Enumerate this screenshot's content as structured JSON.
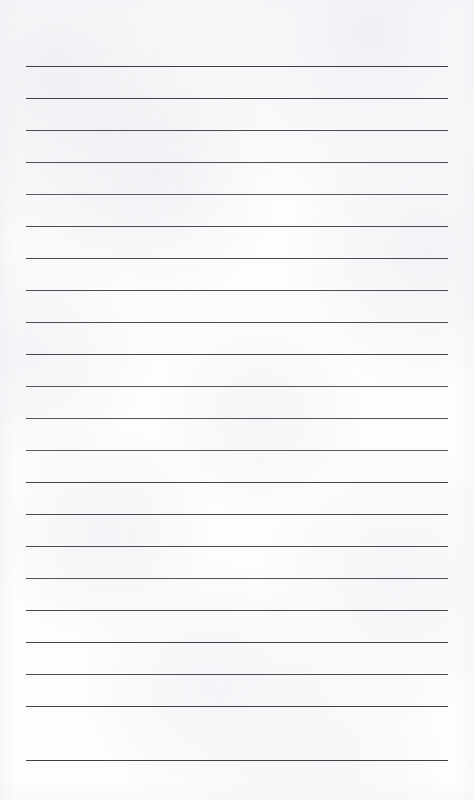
{
  "document": {
    "type": "lined-paper-template",
    "title": "Blank Lined Paper",
    "page_width": 474,
    "page_height": 800,
    "paper_color": "#fdfdfd",
    "line_color": "#4a4a4d",
    "content_text": "",
    "line_count": 22,
    "line_left_x": 26,
    "line_right_x": 448,
    "line_width": 422,
    "first_line_y": 66,
    "line_spacing": 32,
    "line_thickness": 1,
    "lines": [
      {
        "index": 1,
        "y": 66,
        "color": "#3f3f44",
        "thickness": 1,
        "content": ""
      },
      {
        "index": 2,
        "y": 98,
        "color": "#414146",
        "thickness": 1,
        "content": ""
      },
      {
        "index": 3,
        "y": 130,
        "color": "#4b4b50",
        "thickness": 1,
        "content": ""
      },
      {
        "index": 4,
        "y": 162,
        "color": "#4e4e53",
        "thickness": 1,
        "content": ""
      },
      {
        "index": 5,
        "y": 194,
        "color": "#5a5a5f",
        "thickness": 1,
        "content": ""
      },
      {
        "index": 6,
        "y": 226,
        "color": "#4a4a4f",
        "thickness": 1,
        "content": ""
      },
      {
        "index": 7,
        "y": 258,
        "color": "#48484d",
        "thickness": 1,
        "content": ""
      },
      {
        "index": 8,
        "y": 290,
        "color": "#4d4d52",
        "thickness": 1,
        "content": ""
      },
      {
        "index": 9,
        "y": 322,
        "color": "#4c4c51",
        "thickness": 1,
        "content": ""
      },
      {
        "index": 10,
        "y": 354,
        "color": "#45454a",
        "thickness": 1,
        "content": ""
      },
      {
        "index": 11,
        "y": 386,
        "color": "#56565b",
        "thickness": 1,
        "content": ""
      },
      {
        "index": 12,
        "y": 418,
        "color": "#525257",
        "thickness": 1,
        "content": ""
      },
      {
        "index": 13,
        "y": 450,
        "color": "#5b5b60",
        "thickness": 1,
        "content": ""
      },
      {
        "index": 14,
        "y": 482,
        "color": "#45454a",
        "thickness": 1,
        "content": ""
      },
      {
        "index": 15,
        "y": 514,
        "color": "#48484d",
        "thickness": 1,
        "content": ""
      },
      {
        "index": 16,
        "y": 546,
        "color": "#4a4a4f",
        "thickness": 1,
        "content": ""
      },
      {
        "index": 17,
        "y": 578,
        "color": "#515156",
        "thickness": 1,
        "content": ""
      },
      {
        "index": 18,
        "y": 610,
        "color": "#47474c",
        "thickness": 1,
        "content": ""
      },
      {
        "index": 19,
        "y": 642,
        "color": "#434348",
        "thickness": 1,
        "content": ""
      },
      {
        "index": 20,
        "y": 674,
        "color": "#4c4c51",
        "thickness": 1,
        "content": ""
      },
      {
        "index": 21,
        "y": 706,
        "color": "#414146",
        "thickness": 1,
        "content": ""
      },
      {
        "index": 22,
        "y": 760,
        "color": "#3e3e43",
        "thickness": 1,
        "content": ""
      }
    ]
  }
}
